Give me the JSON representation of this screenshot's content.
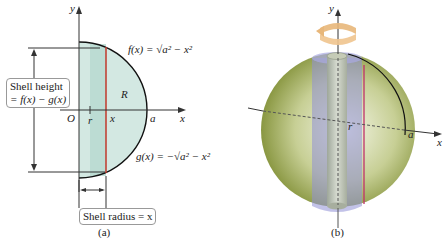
{
  "panel_a": {
    "caption": "(a)",
    "axis_y": "y",
    "axis_x": "x",
    "origin": "O",
    "label_r": "r",
    "label_x": "x",
    "label_a": "a",
    "region": "R",
    "f_label": "f(x) = √a² − x²",
    "g_label": "g(x) = −√a² − x²",
    "shell_height_line1": "Shell height",
    "shell_height_line2": "= f(x) − g(x)",
    "shell_radius": "Shell radius = x"
  },
  "panel_b": {
    "caption": "(b)",
    "axis_y": "y",
    "axis_x": "x",
    "label_r": "r",
    "label_a": "a"
  },
  "colors": {
    "region_fill": "#cfe6e0",
    "shell_strip": "#b8d9d2",
    "red_line": "#c0392b",
    "sphere": "#8a9a3c",
    "shell_blue": "#8f8fd6",
    "rotation_arrow": "#e8b77a"
  }
}
